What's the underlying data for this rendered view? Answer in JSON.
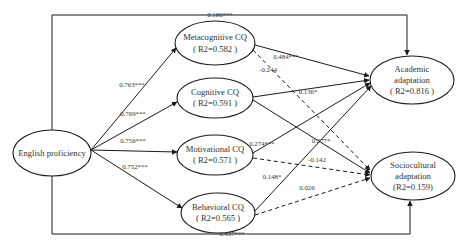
{
  "diagram": {
    "type": "structural-equation-path-model",
    "nodes": {
      "english": {
        "line1": "English proficiency",
        "line2": ""
      },
      "meta": {
        "line1": "Metacognitive CQ",
        "line2": "( R2=0.582 )"
      },
      "cog": {
        "line1": "Cognitive CQ",
        "line2": "( R2=0.591 )"
      },
      "motiv": {
        "line1": "Motivational CQ",
        "line2": "( R2=0.571 )"
      },
      "behav": {
        "line1": "Behavioral CQ",
        "line2": "( R2=0.565 )"
      },
      "academic": {
        "line1": "Academic",
        "line2": "adaptation",
        "line3": "( R2=0.816 )"
      },
      "socio": {
        "line1": "Sociocultural",
        "line2": "adaptation",
        "line3": "(R2=0.159)"
      }
    },
    "edges": {
      "eng_meta": {
        "from": "English proficiency",
        "to": "Metacognitive CQ",
        "label": "0.763***",
        "style": "solid"
      },
      "eng_cog": {
        "from": "English proficiency",
        "to": "Cognitive CQ",
        "label": "0.769***",
        "style": "solid"
      },
      "eng_motiv": {
        "from": "English proficiency",
        "to": "Motivational CQ",
        "label": "0.756***",
        "style": "solid"
      },
      "eng_behav": {
        "from": "English proficiency",
        "to": "Behavioral CQ",
        "label": "0.752***",
        "style": "solid"
      },
      "eng_academic": {
        "from": "English proficiency",
        "to": "Academic adaptation",
        "label": "0.180***",
        "style": "solid"
      },
      "eng_socio": {
        "from": "English proficiency",
        "to": "Sociocultural adaptation",
        "label": "0.437***",
        "style": "solid"
      },
      "meta_academic": {
        "from": "Metacognitive CQ",
        "to": "Academic adaptation",
        "label": "0.484***",
        "style": "solid"
      },
      "meta_socio": {
        "from": "Metacognitive CQ",
        "to": "Sociocultural adaptation",
        "label": "-0.244",
        "style": "dashed"
      },
      "cog_academic": {
        "from": "Cognitive CQ",
        "to": "Academic adaptation",
        "label": "0.136*",
        "style": "solid"
      },
      "cog_socio": {
        "from": "Cognitive CQ",
        "to": "Sociocultural adaptation",
        "label": "0.277*",
        "style": "solid"
      },
      "motiv_academic": {
        "from": "Motivational CQ",
        "to": "Academic adaptation",
        "label": "0.274***",
        "style": "solid"
      },
      "motiv_socio": {
        "from": "Motivational CQ",
        "to": "Sociocultural adaptation",
        "label": "-0.142",
        "style": "dashed"
      },
      "behav_academic": {
        "from": "Behavioral CQ",
        "to": "Academic adaptation",
        "label": "0.148*",
        "style": "solid"
      },
      "behav_socio": {
        "from": "Behavioral CQ",
        "to": "Sociocultural adaptation",
        "label": "0.026",
        "style": "dashed"
      }
    },
    "colors": {
      "stroke": "#1a1a1a",
      "text": "#333333",
      "background": "#ffffff"
    }
  }
}
